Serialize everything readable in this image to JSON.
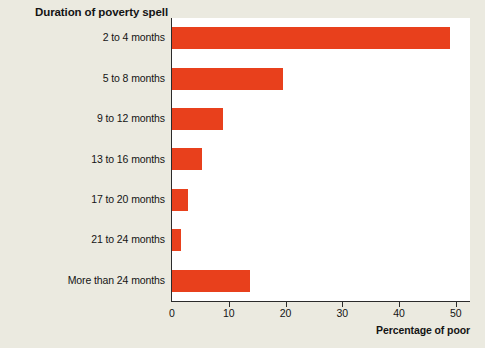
{
  "chart_data": {
    "type": "bar",
    "orientation": "horizontal",
    "title": "Duration of poverty spell",
    "xlabel": "Percentage of poor",
    "ylabel": "Duration of poverty spell",
    "categories": [
      "2 to 4 months",
      "5 to 8 months",
      "9 to 12 months",
      "13 to 16 months",
      "17 to 20 months",
      "21 to 24 months",
      "More than 24 months"
    ],
    "values": [
      49.0,
      19.5,
      9.0,
      5.3,
      2.8,
      1.5,
      13.8
    ],
    "xlim": [
      0,
      52.5
    ],
    "xticks": [
      0,
      10,
      20,
      30,
      40,
      50
    ],
    "xtick_labels": [
      "0",
      "10",
      "20",
      "30",
      "40",
      "50"
    ],
    "grid": false,
    "legend": "none",
    "colors": {
      "bar": "#e8401c",
      "plot_background": "#ffffff",
      "page_background": "#ebeae0",
      "axis": "#2b2b2b",
      "text": "#141414"
    }
  }
}
